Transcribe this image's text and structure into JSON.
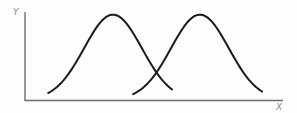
{
  "chart_data": {
    "type": "line",
    "title": "",
    "xlabel": "X",
    "ylabel": "Y",
    "xlim": [
      0,
      10
    ],
    "ylim": [
      0,
      1
    ],
    "grid": false,
    "legend": "none",
    "ticks": {
      "x": [],
      "y": []
    },
    "series": [
      {
        "name": "curve-1",
        "shape": "gaussian",
        "peak_x": 3.41,
        "peak_y": 0.97,
        "sigma": 1.12,
        "x_start": 0.9,
        "x_end": 5.7
      },
      {
        "name": "curve-2",
        "shape": "gaussian",
        "peak_x": 6.78,
        "peak_y": 0.97,
        "sigma": 1.12,
        "x_start": 4.19,
        "x_end": 9.19
      }
    ],
    "colors": {
      "curve": "#1a1a1a",
      "axis": "#6e6e6e",
      "label": "#8a8a8a"
    }
  }
}
